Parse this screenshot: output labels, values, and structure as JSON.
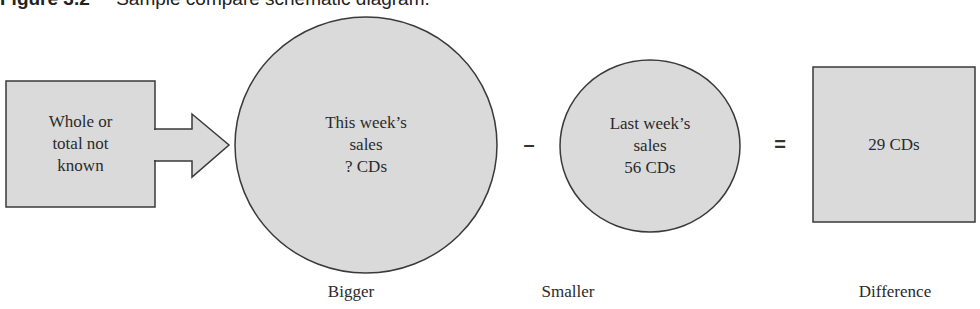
{
  "figure": {
    "label": "Figure 3.2",
    "title": "Sample compare schematic diagram."
  },
  "colors": {
    "fill": "#dadada",
    "stroke": "#3a3a3a",
    "text": "#2a2a2a"
  },
  "nodes": {
    "whole": {
      "lines": [
        "Whole or",
        "total not",
        "known"
      ]
    },
    "bigger": {
      "lines": [
        "This week’s",
        "sales",
        "? CDs"
      ],
      "caption": "Bigger"
    },
    "smaller": {
      "lines": [
        "Last week’s",
        "sales",
        "56 CDs"
      ],
      "caption": "Smaller"
    },
    "difference": {
      "lines": [
        "29 CDs"
      ],
      "caption": "Difference"
    }
  },
  "operators": {
    "minus": "–",
    "equals": "="
  }
}
